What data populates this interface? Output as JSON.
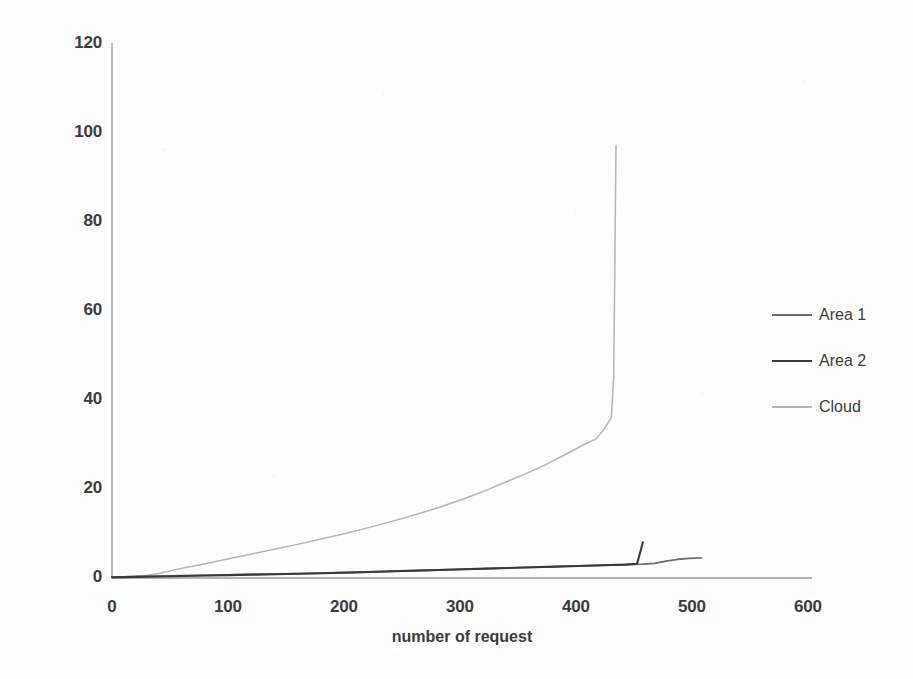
{
  "chart_data": {
    "type": "line",
    "title": "",
    "xlabel": "number of request",
    "ylabel": "response time (ms)",
    "xlim": [
      0,
      600
    ],
    "ylim": [
      0,
      120
    ],
    "xticks": [
      "0",
      "100",
      "200",
      "300",
      "400",
      "500",
      "600"
    ],
    "yticks": [
      "0",
      "20",
      "40",
      "60",
      "80",
      "100",
      "120"
    ],
    "grid": false,
    "legend_position": "right",
    "colors": {
      "area1": "#6d6d6d",
      "area2": "#3a3a3a",
      "cloud": "#b4b4b4",
      "axis": "#9a9a9a",
      "text": "#3b3b3b"
    },
    "series": [
      {
        "name": "Area 1",
        "color": "#6d6d6d",
        "x": [
          0,
          20,
          40,
          60,
          80,
          100,
          120,
          140,
          160,
          180,
          200,
          220,
          240,
          260,
          280,
          300,
          320,
          340,
          360,
          380,
          400,
          420,
          440,
          455,
          465,
          475,
          485,
          495,
          505
        ],
        "y": [
          0.2,
          0.3,
          0.4,
          0.5,
          0.6,
          0.7,
          0.8,
          0.9,
          1.0,
          1.1,
          1.2,
          1.35,
          1.5,
          1.65,
          1.8,
          1.95,
          2.1,
          2.25,
          2.4,
          2.55,
          2.7,
          2.85,
          3.0,
          3.1,
          3.3,
          3.8,
          4.2,
          4.4,
          4.5
        ]
      },
      {
        "name": "Area 2",
        "color": "#3a3a3a",
        "x": [
          0,
          20,
          40,
          60,
          80,
          100,
          120,
          140,
          160,
          180,
          200,
          220,
          240,
          260,
          280,
          300,
          320,
          340,
          360,
          380,
          400,
          420,
          440,
          450,
          453,
          455
        ],
        "y": [
          0.15,
          0.25,
          0.35,
          0.45,
          0.55,
          0.65,
          0.75,
          0.85,
          0.95,
          1.05,
          1.2,
          1.35,
          1.5,
          1.65,
          1.8,
          1.95,
          2.1,
          2.25,
          2.4,
          2.55,
          2.7,
          2.85,
          3.0,
          3.2,
          6.0,
          8.0
        ]
      },
      {
        "name": "Cloud",
        "color": "#b4b4b4",
        "x": [
          0,
          10,
          20,
          30,
          40,
          50,
          60,
          80,
          100,
          120,
          140,
          160,
          180,
          200,
          220,
          240,
          260,
          280,
          300,
          320,
          340,
          355,
          370,
          385,
          395,
          405,
          415,
          422,
          428,
          430,
          431,
          432
        ],
        "y": [
          0.2,
          0.3,
          0.4,
          0.6,
          1.0,
          1.6,
          2.2,
          3.2,
          4.3,
          5.4,
          6.5,
          7.6,
          8.8,
          10.0,
          11.3,
          12.7,
          14.2,
          15.8,
          17.6,
          19.6,
          21.8,
          23.4,
          25.2,
          27.2,
          28.6,
          30.0,
          31.2,
          33.5,
          36.0,
          45.0,
          70.0,
          97.0
        ]
      }
    ]
  },
  "axis": {
    "y_title": "response time (ms)",
    "x_title": "number of request",
    "y_labels": [
      "120",
      "100",
      "80",
      "60",
      "40",
      "20",
      "0"
    ],
    "x_labels": [
      "0",
      "100",
      "200",
      "300",
      "400",
      "500",
      "600"
    ]
  },
  "legend": {
    "items": [
      {
        "label": "Area 1",
        "color": "#6d6d6d"
      },
      {
        "label": "Area 2",
        "color": "#3a3a3a"
      },
      {
        "label": "Cloud",
        "color": "#b4b4b4"
      }
    ]
  }
}
